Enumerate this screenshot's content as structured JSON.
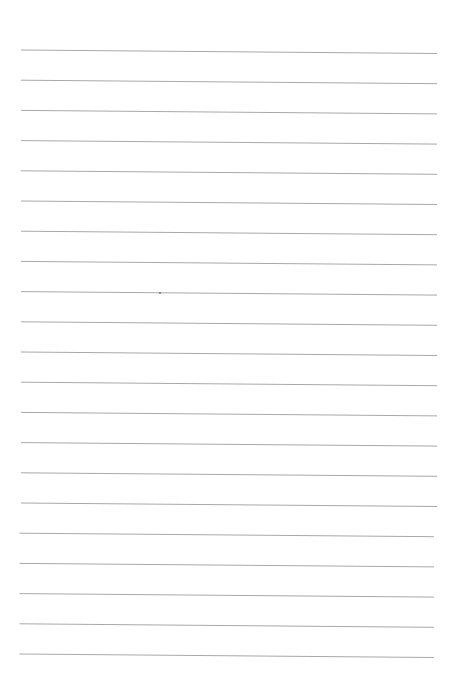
{
  "page": {
    "type": "lined-paper",
    "background": "#ffffff",
    "line_color": "#a8a8a8",
    "line_count": 21,
    "first_line_y": 50,
    "line_spacing": 30.2,
    "line_x_start": 21,
    "line_x_end": 437,
    "line_tilt": 3.5,
    "stray_mark": {
      "x": 159,
      "y": 292
    }
  }
}
